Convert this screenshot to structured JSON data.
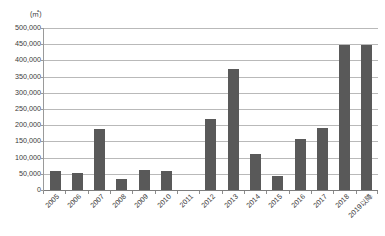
{
  "chart_data": {
    "type": "bar",
    "title": "",
    "subtitle": "",
    "unit_label": "(㎡)",
    "xlabel": "",
    "ylabel": "",
    "ylim": [
      0,
      500000
    ],
    "ytick_step": 50000,
    "grid": true,
    "legend": "none",
    "bar_color": "#595959",
    "gridline_color": "#b9b9b9",
    "axis_color": "#7d7d7d",
    "categories": [
      "2005",
      "2006",
      "2007",
      "2008",
      "2009",
      "2010",
      "2011",
      "2012",
      "2013",
      "2014",
      "2015",
      "2016",
      "2017",
      "2018",
      "2019以降"
    ],
    "values": [
      60000,
      52000,
      188000,
      33000,
      62000,
      59000,
      0,
      219000,
      372000,
      110000,
      44000,
      157000,
      190000,
      447000,
      448000
    ],
    "ytick_labels": [
      "500,000",
      "450,000",
      "400,000",
      "350,000",
      "300,000",
      "250,000",
      "200,000",
      "150,000",
      "100,000",
      "50,000",
      "0"
    ],
    "ytick_values": [
      500000,
      450000,
      400000,
      350000,
      300000,
      250000,
      200000,
      150000,
      100000,
      50000,
      0
    ]
  }
}
